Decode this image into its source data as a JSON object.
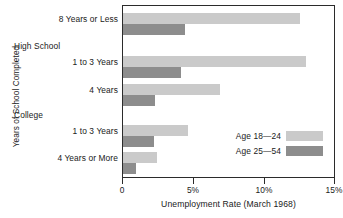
{
  "chart_data": {
    "type": "bar",
    "orientation": "horizontal",
    "title": "",
    "xlabel": "Unemployment Rate (March 1968)",
    "ylabel": "Years of School Completed",
    "xlim": [
      0,
      15
    ],
    "xticks": [
      0,
      5,
      10,
      15
    ],
    "xtick_labels": [
      "0",
      "5%",
      "10%",
      "15%"
    ],
    "grid": false,
    "legend_position": "inside-lower-right",
    "categories": [
      "8 Years or Less",
      "1 to 3 Years",
      "4 Years",
      "1 to 3 Years",
      "4 Years or More"
    ],
    "group_headers": [
      "High School",
      "College"
    ],
    "series": [
      {
        "name": "Age 18—24",
        "color": "#cacaca",
        "values": [
          12.6,
          13.0,
          6.9,
          4.6,
          2.4
        ]
      },
      {
        "name": "Age 25—54",
        "color": "#8d8d8d",
        "values": [
          4.4,
          4.1,
          2.3,
          2.2,
          0.9
        ]
      }
    ]
  },
  "axis": {
    "y_title": "Years of School Completed",
    "x_title": "Unemployment Rate (March 1968)",
    "ticks": [
      {
        "label": "0",
        "value": 0
      },
      {
        "label": "5%",
        "value": 5
      },
      {
        "label": "10%",
        "value": 10
      },
      {
        "label": "15%",
        "value": 15
      }
    ]
  },
  "categories": [
    {
      "label": "8 Years or Less",
      "type": "item"
    },
    {
      "label": "High School",
      "type": "group"
    },
    {
      "label": "1 to 3 Years",
      "type": "item"
    },
    {
      "label": "4 Years",
      "type": "item"
    },
    {
      "label": "College",
      "type": "group"
    },
    {
      "label": "1 to 3 Years",
      "type": "item"
    },
    {
      "label": "4 Years or More",
      "type": "item"
    }
  ],
  "legend": [
    {
      "label": "Age 18—24",
      "color": "#cacaca"
    },
    {
      "label": "Age 25—54",
      "color": "#8d8d8d"
    }
  ]
}
